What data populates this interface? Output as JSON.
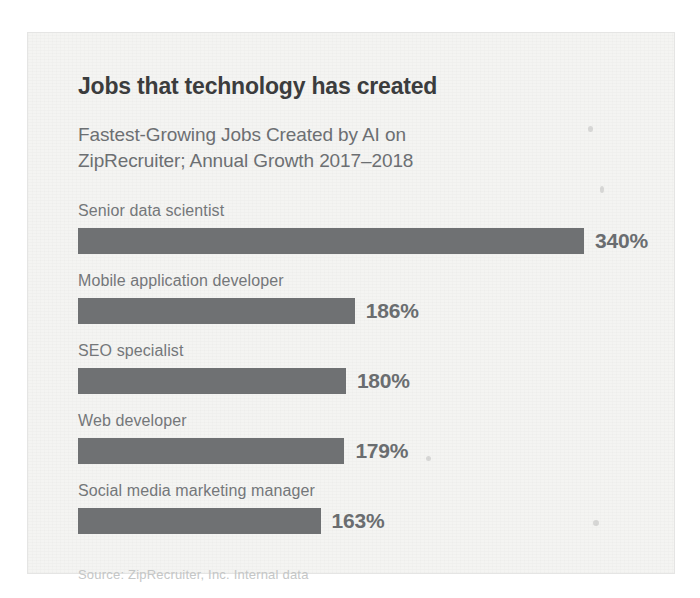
{
  "chart_data": {
    "type": "bar",
    "orientation": "horizontal",
    "title": "Jobs that technology has created",
    "subtitle": "Fastest-Growing Jobs Created by AI on ZipRecruiter; Annual Growth 2017–2018",
    "subtitle_lines": [
      "Fastest-Growing Jobs Created by AI on",
      "ZipRecruiter; Annual Growth 2017–2018"
    ],
    "categories": [
      "Senior data scientist",
      "Mobile application developer",
      "SEO specialist",
      "Web developer",
      "Social media marketing manager"
    ],
    "values": [
      340,
      186,
      180,
      179,
      163
    ],
    "value_labels": [
      "340%",
      "186%",
      "180%",
      "179%",
      "163%"
    ],
    "unit": "%",
    "xlabel": "",
    "ylabel": "",
    "xlim": [
      0,
      340
    ],
    "grid": false,
    "legend": false,
    "source": "Source: ZipRecruiter, Inc. Internal data",
    "colors": {
      "bar": "#6f7173",
      "title": "#3b3c3d",
      "subtitle": "#6c6f72",
      "label": "#74777a",
      "value": "#6a6d70",
      "source": "#c4c6c6",
      "card_background": "#f4f4f2",
      "page_background": "#ffffff"
    }
  }
}
